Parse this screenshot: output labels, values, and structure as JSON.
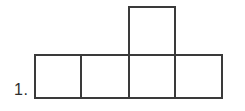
{
  "figure": {
    "label": "1.",
    "label_name": "problem-number",
    "background_color": "#ffffff",
    "stroke_color": "#3a3a3a",
    "fill_color": "#ffffff",
    "stroke_width": 2,
    "unit_square_width": 46,
    "unit_square_height": 43,
    "squares": [
      {
        "name": "bottom-row-square-1",
        "x": 35,
        "y": 55,
        "width": 46,
        "height": 43
      },
      {
        "name": "bottom-row-square-2",
        "x": 81,
        "y": 55,
        "width": 48,
        "height": 43
      },
      {
        "name": "bottom-row-square-3",
        "x": 129,
        "y": 55,
        "width": 46,
        "height": 43
      },
      {
        "name": "bottom-row-square-4",
        "x": 175,
        "y": 55,
        "width": 47,
        "height": 43
      },
      {
        "name": "top-square",
        "x": 129,
        "y": 7,
        "width": 46,
        "height": 48
      }
    ]
  }
}
